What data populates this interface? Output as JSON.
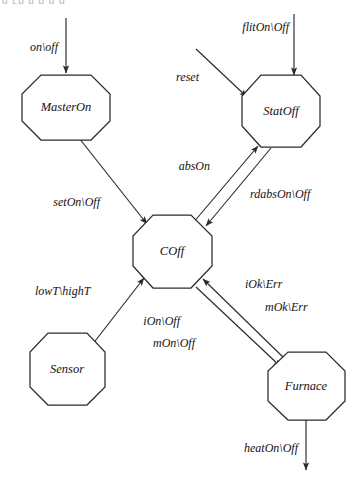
{
  "figure": {
    "type": "state-transition-diagram",
    "clipped_top_caption": "a ca a  a  a a",
    "background_color": "#ffffff",
    "stroke_color": "#2b2b2b",
    "text_color": "#111111"
  },
  "nodes": [
    {
      "id": "MasterOn",
      "label": "MasterOn",
      "cx": 66,
      "cy": 107,
      "rx": 44,
      "ry": 33
    },
    {
      "id": "StatOff",
      "label": "StatOff",
      "cx": 281,
      "cy": 111,
      "rx": 39,
      "ry": 36
    },
    {
      "id": "COff",
      "label": "COff",
      "cx": 172,
      "cy": 251,
      "rx": 40,
      "ry": 37
    },
    {
      "id": "Sensor",
      "label": "Sensor",
      "cx": 67,
      "cy": 369,
      "rx": 38,
      "ry": 36
    },
    {
      "id": "Furnace",
      "label": "Furnace",
      "cx": 306,
      "cy": 386,
      "rx": 39,
      "ry": 34
    }
  ],
  "edges": [
    {
      "id": "on-off",
      "label": "on\\off",
      "from": "external-top-left",
      "to": "MasterOn",
      "label_x": 58,
      "label_y": 48,
      "anchor": "end"
    },
    {
      "id": "flit-on-off",
      "label": "flitOn\\Off",
      "from": "external-top-right",
      "to": "StatOff",
      "label_x": 289,
      "label_y": 28,
      "anchor": "end"
    },
    {
      "id": "reset",
      "label": "reset",
      "from": "external-left",
      "to": "StatOff",
      "label_x": 199,
      "label_y": 78,
      "anchor": "end"
    },
    {
      "id": "set-on-off",
      "label": "setOn\\Off",
      "from": "MasterOn",
      "to": "COff",
      "label_x": 100,
      "label_y": 203,
      "anchor": "end"
    },
    {
      "id": "abs-on",
      "label": "absOn",
      "from": "COff",
      "to": "StatOff",
      "label_x": 210,
      "label_y": 167,
      "anchor": "end"
    },
    {
      "id": "rdabs-on-off",
      "label": "rdabsOn\\Off",
      "from": "StatOff",
      "to": "COff",
      "label_x": 250,
      "label_y": 195,
      "anchor": "start"
    },
    {
      "id": "lowt-hight",
      "label": "lowT\\highT",
      "from": "Sensor",
      "to": "COff",
      "label_x": 35,
      "label_y": 292,
      "anchor": "start"
    },
    {
      "id": "iok-err",
      "label": "iOk\\Err",
      "from": "Furnace",
      "to": "COff",
      "label_x": 245,
      "label_y": 285,
      "anchor": "start"
    },
    {
      "id": "mok-err",
      "label": "mOk\\Err",
      "from": "Furnace",
      "to": "COff",
      "label_x": 265,
      "label_y": 308,
      "anchor": "start"
    },
    {
      "id": "ion-off",
      "label": "iOn\\Off",
      "from": "COff",
      "to": "Furnace",
      "label_x": 180,
      "label_y": 322,
      "anchor": "end"
    },
    {
      "id": "mon-off",
      "label": "mOn\\Off",
      "from": "COff",
      "to": "Furnace",
      "label_x": 195,
      "label_y": 344,
      "anchor": "end"
    },
    {
      "id": "heat-on-off",
      "label": "heatOn\\Off",
      "from": "Furnace",
      "to": "external-bottom",
      "label_x": 298,
      "label_y": 449,
      "anchor": "end"
    }
  ]
}
